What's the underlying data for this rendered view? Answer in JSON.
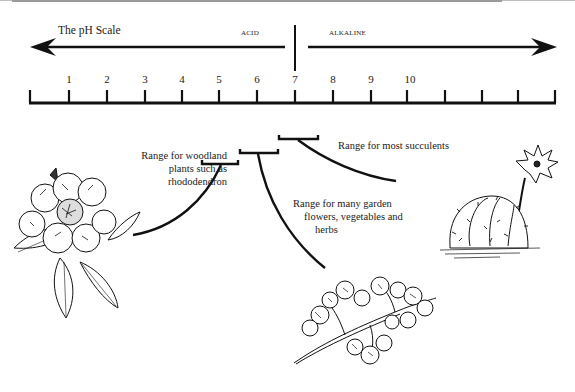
{
  "diagram": {
    "title": "The pH Scale",
    "acid_label": "ACID",
    "alkaline_label": "ALKALINE",
    "scale": {
      "ticks_labeled": [
        "1",
        "2",
        "3",
        "4",
        "5",
        "6",
        "7",
        "8",
        "9",
        "10"
      ],
      "tick_positions_x": [
        69,
        107,
        145,
        182,
        219,
        257,
        295,
        333,
        371,
        407
      ],
      "unlabeled_ticks_x": [
        30,
        445,
        482,
        518,
        555
      ],
      "neutral_point": "7"
    },
    "ranges": [
      {
        "id": "woodland",
        "lines": [
          "Range for woodland",
          "plants such as",
          "rhododendron"
        ],
        "ph_min": 4.5,
        "ph_max": 5.5,
        "plant": "rhododendron"
      },
      {
        "id": "garden",
        "lines": [
          "Range for many garden",
          "flowers, vegetables and",
          "herbs"
        ],
        "ph_min": 5.5,
        "ph_max": 6.5,
        "plant": "parsley"
      },
      {
        "id": "succulents",
        "lines": [
          "Range for most succulents"
        ],
        "ph_min": 6.5,
        "ph_max": 7.5,
        "plant": "cactus"
      }
    ],
    "illustrations": [
      "rhododendron-illustration",
      "parsley-illustration",
      "cactus-illustration"
    ],
    "colors": {
      "ink": "#1a1a1a",
      "background": "#ffffff",
      "border": "#9a9a9a"
    }
  }
}
